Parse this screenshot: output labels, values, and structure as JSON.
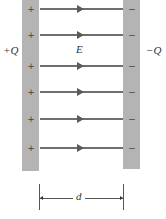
{
  "diagram": {
    "left_plate": {
      "charge_label": "+Q",
      "sign": "+",
      "color": "#b4b4b4"
    },
    "right_plate": {
      "charge_label": "−Q",
      "sign": "−",
      "color": "#b4b4b4"
    },
    "field": {
      "label": "E",
      "direction": "left-to-right",
      "line_count": 6,
      "line_y": [
        9,
        35,
        66,
        92,
        119,
        148
      ],
      "line_color": "#6e6e6e"
    },
    "separation": {
      "label": "d"
    }
  }
}
